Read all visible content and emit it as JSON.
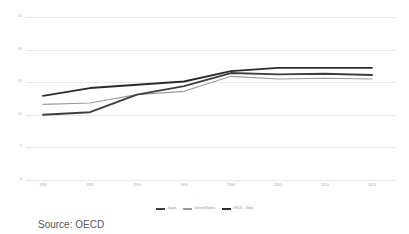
{
  "caption": "Source: OECD",
  "colors": {
    "japan": "#3f3f3f",
    "united_states": "#9a9a9a",
    "oecd_total": "#2b2b2b",
    "gridline": "#e8e8e8",
    "tick_text": "#a6a6a6"
  },
  "legend": {
    "position": "bottom",
    "items": [
      {
        "label": "Japan",
        "color": "#3f3f3f"
      },
      {
        "label": "United States",
        "color": "#9a9a9a"
      },
      {
        "label": "OECD - Total",
        "color": "#2b2b2b"
      }
    ]
  },
  "chart_data": {
    "type": "line",
    "title": "",
    "subtitle": "",
    "xlabel": "",
    "ylabel": "",
    "grid": true,
    "legend_position": "bottom",
    "categories": [
      "1980",
      "1985",
      "1990",
      "1995",
      "2000",
      "2005",
      "2010",
      "2015"
    ],
    "x_tick_labels": [
      "1980",
      "1985",
      "1990",
      "1995",
      "2000",
      "2005",
      "2010",
      "2015"
    ],
    "y_tick_labels": [
      "25",
      "20",
      "15",
      "10",
      "5",
      "0"
    ],
    "ylim": [
      0,
      25
    ],
    "yticks": [
      0,
      5,
      10,
      15,
      20,
      25
    ],
    "series": [
      {
        "name": "Japan",
        "color": "#3f3f3f",
        "values": [
          10.0,
          10.4,
          13.1,
          14.4,
          16.4,
          16.2,
          16.3,
          16.1
        ]
      },
      {
        "name": "United States",
        "color": "#9a9a9a",
        "values": [
          11.6,
          11.8,
          13.1,
          13.6,
          15.9,
          15.5,
          15.6,
          15.5
        ]
      },
      {
        "name": "OECD - Total",
        "color": "#2b2b2b",
        "values": [
          12.9,
          14.1,
          14.6,
          15.1,
          16.7,
          17.2,
          17.2,
          17.2
        ]
      }
    ]
  }
}
